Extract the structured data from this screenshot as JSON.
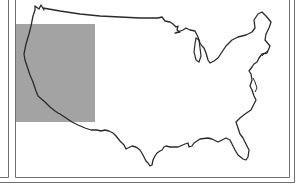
{
  "map": {
    "subject": "Contiguous United States outline",
    "highlighted_region": {
      "label": "Western United States",
      "shape": "rectangle",
      "color": "#a3a3a3"
    },
    "colors": {
      "background": "#ffffff",
      "outline": "#2a2a2a",
      "frame": "#666666",
      "highlight": "#a3a3a3"
    }
  }
}
